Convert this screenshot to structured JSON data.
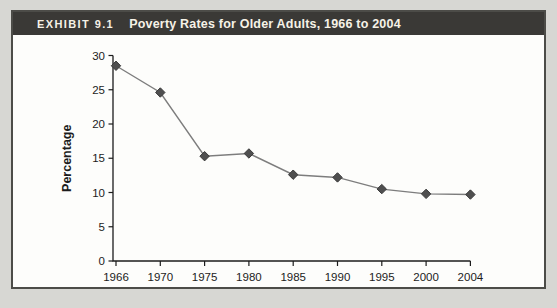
{
  "page": {
    "background": "#d7d7d3"
  },
  "exhibit": {
    "tag": "EXHIBIT 9.1",
    "title": "Poverty Rates for Older Adults, 1966 to 2004",
    "header_bg": "#3a3936",
    "header_text_color": "#f6f2e7",
    "panel_bg": "#fdfdfb",
    "panel_border_color": "#4c4c48"
  },
  "chart_data": {
    "type": "line",
    "categories": [
      "1966",
      "1970",
      "1975",
      "1980",
      "1985",
      "1990",
      "1995",
      "2000",
      "2004"
    ],
    "values": [
      28.5,
      24.6,
      15.3,
      15.7,
      12.6,
      12.2,
      10.5,
      9.8,
      9.7
    ],
    "title": "Poverty Rates for Older Adults, 1966 to 2004",
    "xlabel": "",
    "ylabel": "Percentage",
    "ylim": [
      0,
      30
    ],
    "yticks": [
      0,
      5,
      10,
      15,
      20,
      25,
      30
    ],
    "grid": false,
    "legend": "none",
    "marker": "diamond",
    "series_name": "Poverty rate (65 and older)",
    "line_color": "#7d7d7d",
    "marker_color": "#4f4f4f",
    "marker_edge_color": "#3a3a3a",
    "axis_color": "#1c1c1c",
    "tick_label_color": "#1c1c1c"
  }
}
